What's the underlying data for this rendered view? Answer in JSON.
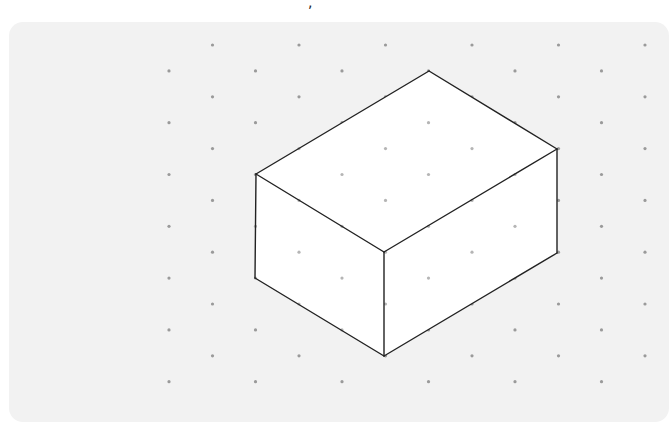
{
  "figure": {
    "stray_mark": ",",
    "colors": {
      "background": "#ffffff",
      "panel": "#f2f2f2",
      "dot": "#9a9a9a",
      "dot_on_face": "#b5b5b5",
      "face": "#ffffff",
      "edge": "#222222"
    },
    "grid": {
      "type": "isometric-dots",
      "row_start_y": 45,
      "row_step_y": 25.9,
      "rows": 14,
      "col_step_x": 86.5,
      "even_row_start_x": 212.5,
      "odd_row_start_x": 169,
      "cols": 6,
      "dot_radius": 1.6
    },
    "box": {
      "vertices": {
        "top_back": [
          429,
          71
        ],
        "right_top": [
          557,
          149
        ],
        "front_top": [
          384,
          252
        ],
        "left_top": [
          256,
          174
        ],
        "left_bottom": [
          255,
          278
        ],
        "front_bottom": [
          384,
          356
        ],
        "right_bottom": [
          557,
          253
        ]
      }
    }
  }
}
